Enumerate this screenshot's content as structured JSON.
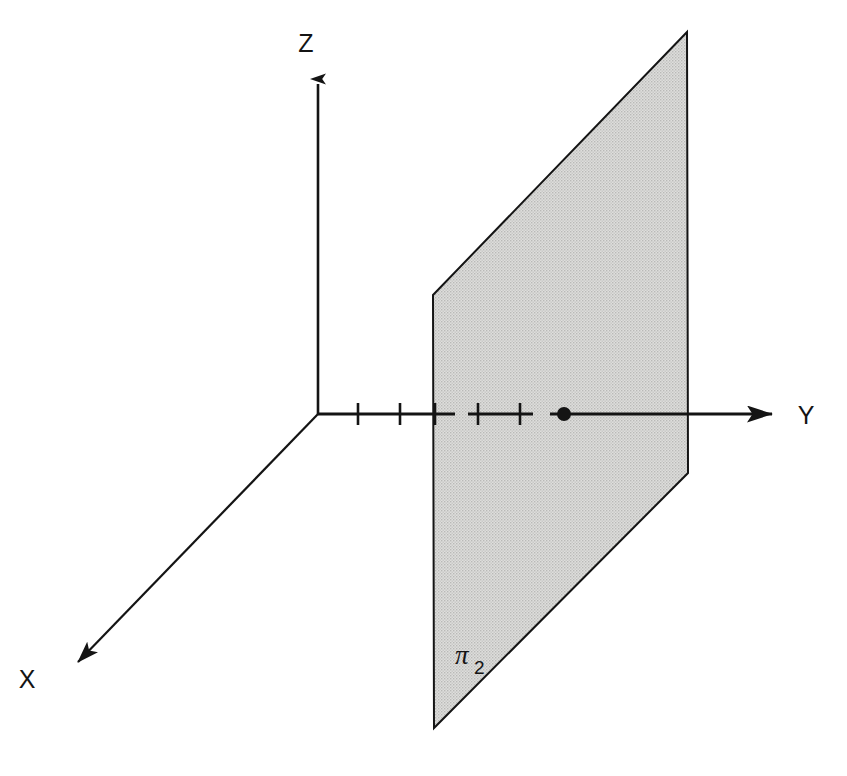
{
  "figure": {
    "background_color": "#ffffff",
    "ink_color": "#141414",
    "plane_fill_color": "#d4d4d4",
    "plane_stroke_color": "#141414",
    "width": 847,
    "height": 776
  },
  "axes": {
    "origin": {
      "x": 318,
      "y": 414
    },
    "items": [
      {
        "name": "x-axis",
        "label": "X",
        "label_x": 27,
        "label_y": 688,
        "from_x": 318,
        "from_y": 414,
        "to_x": 62,
        "to_y": 678,
        "arrow": true,
        "stroke_width": 2.2
      },
      {
        "name": "y-axis",
        "label": "Y",
        "label_x": 806,
        "label_y": 424,
        "from_x": 318,
        "from_y": 414,
        "to_x": 790,
        "to_y": 414,
        "arrow": true,
        "stroke_width": 3.2
      },
      {
        "name": "z-axis",
        "label": "Z",
        "label_x": 306,
        "label_y": 52,
        "from_x": 318,
        "from_y": 414,
        "to_x": 318,
        "to_y": 68,
        "arrow": true,
        "stroke_width": 2.6
      }
    ]
  },
  "plane": {
    "name": "pi-2",
    "label_pi": "π",
    "label_subscript": "2",
    "label_x": 455,
    "label_y": 664,
    "corners": [
      {
        "x": 433,
        "y": 295
      },
      {
        "x": 687,
        "y": 32
      },
      {
        "x": 688,
        "y": 473
      },
      {
        "x": 434,
        "y": 728
      }
    ],
    "points_path": "433,295 687,32 688,473 434,728"
  },
  "y_axis_ticks": {
    "tick_half_height": 11,
    "tick_stroke_width": 2.6,
    "positions": [
      {
        "x": 358,
        "label": ""
      },
      {
        "x": 400,
        "label": ""
      },
      {
        "x": 435,
        "label": ""
      },
      {
        "x": 478,
        "label": ""
      },
      {
        "x": 520,
        "label": ""
      }
    ]
  },
  "y_axis_segments": [
    {
      "from_x": 318,
      "to_x": 455,
      "style": "solid",
      "stroke_width": 3.2
    },
    {
      "from_x": 468,
      "to_x": 533,
      "style": "solid",
      "stroke_width": 3.2
    },
    {
      "from_x": 550,
      "to_x": 790,
      "style": "solid",
      "stroke_width": 3.2
    }
  ],
  "marked_point": {
    "name": "point-on-y-axis",
    "x": 564,
    "y": 414,
    "radius": 7,
    "fill": "#141414"
  },
  "chart_data": {
    "type": "diagram",
    "axis_labels": [
      "X",
      "Y",
      "Z"
    ],
    "annotations": [
      "π₂"
    ],
    "tick_count_on_y": 5,
    "marked_points": 1
  }
}
